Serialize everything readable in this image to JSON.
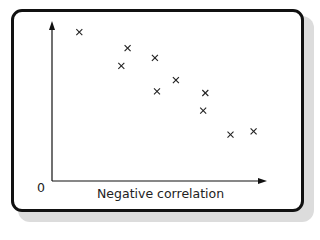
{
  "chart_data": {
    "type": "scatter",
    "title": "",
    "xlabel": "Negative correlation",
    "ylabel": "",
    "origin_label": "0",
    "grid": false,
    "legend": null,
    "marker": "x",
    "points": [
      {
        "x": 1.3,
        "y": 9.3
      },
      {
        "x": 3.6,
        "y": 8.3
      },
      {
        "x": 3.3,
        "y": 7.2
      },
      {
        "x": 4.9,
        "y": 7.7
      },
      {
        "x": 5.0,
        "y": 5.6
      },
      {
        "x": 5.9,
        "y": 6.3
      },
      {
        "x": 7.3,
        "y": 5.5
      },
      {
        "x": 7.2,
        "y": 4.4
      },
      {
        "x": 8.5,
        "y": 2.9
      },
      {
        "x": 9.6,
        "y": 3.1
      }
    ],
    "xlim": [
      0,
      10
    ],
    "ylim": [
      0,
      10
    ],
    "colors": {
      "marker": "#222222",
      "axis": "#111111",
      "frame": "#111111"
    }
  }
}
